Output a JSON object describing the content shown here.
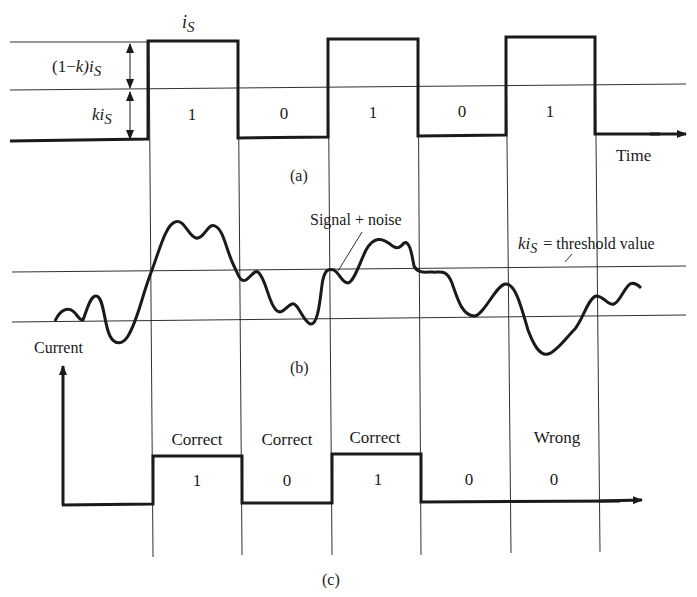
{
  "figure": {
    "panel_a": {
      "caption": "(a)",
      "top_label": "i",
      "top_label_sub": "S",
      "upper_segment_label_prefix": "(1−",
      "upper_segment_label_k": "k",
      "upper_segment_label_suffix": ")i",
      "upper_segment_label_sub": "S",
      "lower_segment_label": "ki",
      "lower_segment_label_sub": "S",
      "time_axis_label": "Time",
      "bits": [
        "1",
        "0",
        "1",
        "0",
        "1"
      ]
    },
    "panel_b": {
      "caption": "(b)",
      "signal_label": "Signal + noise",
      "threshold_label_ki": "ki",
      "threshold_label_sub": "S",
      "threshold_label_rest": "= threshold value",
      "axis_label": "Current"
    },
    "panel_c": {
      "caption": "(c)",
      "bits": [
        "1",
        "0",
        "1",
        "0",
        "0"
      ],
      "verdicts": [
        "Correct",
        "Correct",
        "Correct",
        "",
        "Wrong"
      ]
    }
  },
  "colors": {
    "ink": "#1a1a1a",
    "background": "#ffffff"
  }
}
